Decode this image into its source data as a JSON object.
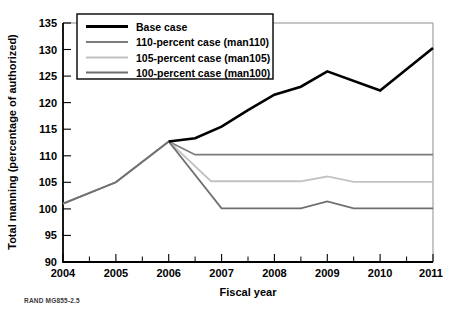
{
  "figure": {
    "credit": "RAND MG855-2.5"
  },
  "chart_data": {
    "type": "line",
    "title": "",
    "xlabel": "Fiscal year",
    "ylabel": "Total manning (percentage of authorized)",
    "xlim": [
      2004,
      2011
    ],
    "ylim": [
      90,
      135
    ],
    "xticks": [
      "2004",
      "2005",
      "2006",
      "2007",
      "2008",
      "2009",
      "2010",
      "2011"
    ],
    "yticks": [
      "90",
      "95",
      "100",
      "105",
      "110",
      "115",
      "120",
      "125",
      "130",
      "135"
    ],
    "x_minor_tick_interval": 0.5,
    "grid": false,
    "legend_position": "top-left",
    "series": [
      {
        "name": "Base case",
        "color": "#000000",
        "width": 2.6,
        "x": [
          2006,
          2006.5,
          2007,
          2007.5,
          2008,
          2008.5,
          2009,
          2010,
          2011
        ],
        "values": [
          112.7,
          113.3,
          115.5,
          118.6,
          121.5,
          123.0,
          125.9,
          122.3,
          130.3
        ]
      },
      {
        "name": "110-percent case (man110)",
        "color": "#7b7b7b",
        "width": 1.8,
        "x": [
          2004,
          2005,
          2006,
          2006.5,
          2011
        ],
        "values": [
          101.0,
          105.0,
          112.7,
          110.2,
          110.2
        ]
      },
      {
        "name": "105-percent case (man105)",
        "color": "#c2c2c2",
        "width": 1.8,
        "x": [
          2004,
          2005,
          2006,
          2006.8,
          2008.5,
          2009,
          2009.5,
          2011
        ],
        "values": [
          101.0,
          105.0,
          112.7,
          105.2,
          105.2,
          106.1,
          105.1,
          105.1
        ]
      },
      {
        "name": "100-percent case (man100)",
        "color": "#6f6f6f",
        "width": 1.8,
        "x": [
          2004,
          2005,
          2006,
          2007,
          2008.5,
          2009,
          2009.5,
          2011
        ],
        "values": [
          101.0,
          105.0,
          112.7,
          100.1,
          100.1,
          101.4,
          100.1,
          100.1
        ]
      }
    ]
  }
}
